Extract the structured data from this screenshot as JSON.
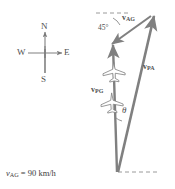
{
  "figure": {
    "type": "vector-triangle-diagram",
    "stroke_color": "#808080",
    "dash_color": "#9a9a9a",
    "text_color": "#4f4f4f"
  },
  "compass": {
    "north": "N",
    "east": "E",
    "south": "S",
    "west": "W"
  },
  "vectors": {
    "v_ag": {
      "symbol": "v",
      "subscript": "AG",
      "label": "vAG"
    },
    "v_pa": {
      "symbol": "v",
      "subscript": "PA",
      "label": "vPA"
    },
    "v_pg": {
      "symbol": "v",
      "subscript": "PG",
      "label": "vPG"
    }
  },
  "angles": {
    "top_angle": "45°",
    "bottom_angle": "θ"
  },
  "caption": {
    "symbol": "v",
    "subscript": "AG",
    "equals": "= 90 km/h",
    "full": "vAG = 90 km/h"
  }
}
